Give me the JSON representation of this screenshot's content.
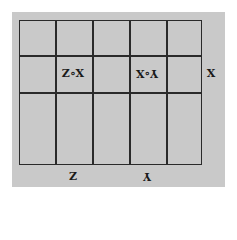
{
  "diagram": {
    "orientation": "rotated 180 degrees",
    "grid": {
      "columns": 5,
      "rows": 3
    },
    "labels": {
      "cell_zx": "Z∘X",
      "cell_xy": "Y∘X",
      "right_axis": "X",
      "bottom_left": "Z",
      "bottom_right": "Y"
    },
    "colors": {
      "background": "#c9c9c9",
      "lines": "#2a2a2a"
    }
  }
}
